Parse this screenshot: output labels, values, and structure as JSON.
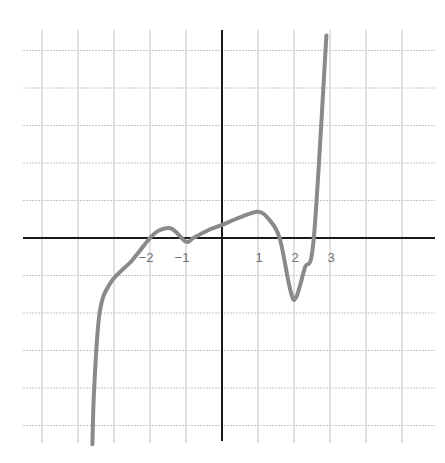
{
  "chart_data": {
    "type": "line",
    "title": "",
    "xlabel": "",
    "ylabel": "",
    "grid": true,
    "x_tick_labels": [
      "−2",
      "−1",
      "1",
      "2",
      "3"
    ],
    "x_ticks": [
      -2,
      -1,
      1,
      2,
      3
    ],
    "xlim": [
      -5.5,
      6
    ],
    "ylim": [
      -5.5,
      5.5
    ],
    "series": [
      {
        "name": "polynomial curve",
        "color": "#8a8a8a",
        "x": [
          -3.6,
          -3.55,
          -3.4,
          -3.1,
          -2.5,
          -2.0,
          -1.75,
          -1.4,
          -1.0,
          -0.8,
          -0.4,
          0.0,
          0.5,
          1.0,
          1.3,
          1.6,
          1.9,
          2.05,
          2.3,
          2.55,
          2.9
        ],
        "y": [
          -5.5,
          -4.0,
          -2.0,
          -1.2,
          -0.6,
          0.0,
          0.2,
          0.25,
          -0.1,
          0.0,
          0.2,
          0.35,
          0.55,
          0.7,
          0.5,
          0.0,
          -1.4,
          -1.6,
          -0.8,
          0.0,
          5.4
        ]
      }
    ],
    "x_zero_crossings_approx": [
      -2.0,
      -1.0,
      1.6,
      2.55
    ],
    "local_extrema_approx": [
      {
        "type": "max",
        "x": -1.4,
        "y": 0.25
      },
      {
        "type": "min",
        "x": -1.0,
        "y": -0.1
      },
      {
        "type": "max",
        "x": 1.0,
        "y": 0.7
      },
      {
        "type": "min",
        "x": 2.05,
        "y": -1.6
      }
    ],
    "colors": {
      "axis": "#1a1a1a",
      "grid": "#c4c4c4",
      "curve": "#8a8a8a",
      "tick_label": "#6f6f6f"
    }
  }
}
